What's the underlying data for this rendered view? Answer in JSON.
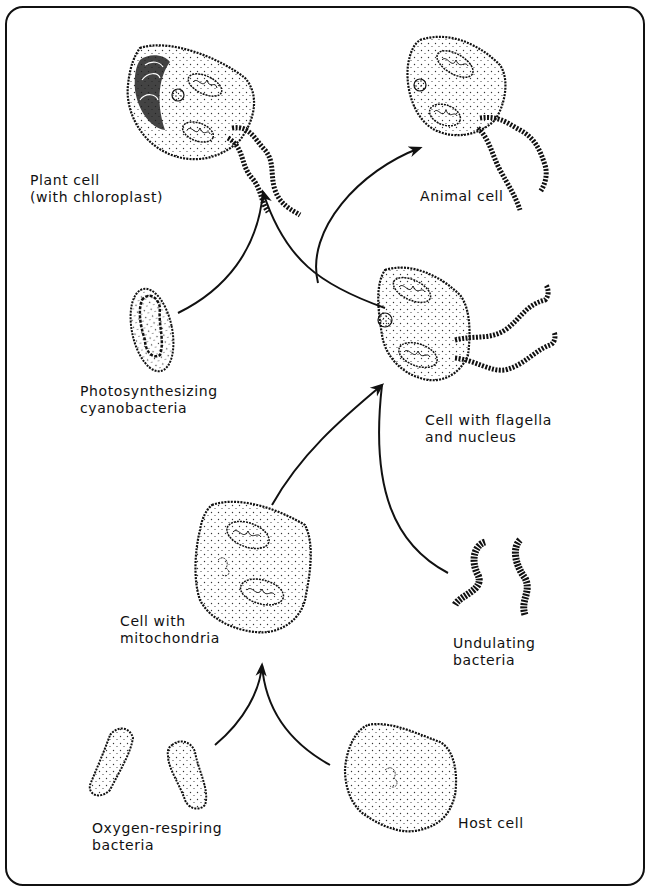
{
  "diagram": {
    "type": "endosymbiosis-flow",
    "colors": {
      "ink": "#111111",
      "background": "#ffffff",
      "stipple": "#333333"
    },
    "nodes": [
      {
        "id": "plant",
        "line1": "Plant cell",
        "line2": "(with chloroplast)"
      },
      {
        "id": "animal",
        "line1": "Animal cell",
        "line2": ""
      },
      {
        "id": "cyano",
        "line1": "Photosynthesizing",
        "line2": "cyanobacteria"
      },
      {
        "id": "flagella",
        "line1": "Cell with flagella",
        "line2": "and nucleus"
      },
      {
        "id": "mito",
        "line1": "Cell with",
        "line2": "mitochondria"
      },
      {
        "id": "undulating",
        "line1": "Undulating",
        "line2": "bacteria"
      },
      {
        "id": "oxygen",
        "line1": "Oxygen-respiring",
        "line2": "bacteria"
      },
      {
        "id": "host",
        "line1": "Host cell",
        "line2": ""
      }
    ],
    "edges": [
      {
        "from": "oxygen",
        "to": "mito"
      },
      {
        "from": "host",
        "to": "mito"
      },
      {
        "from": "mito",
        "to": "flagella"
      },
      {
        "from": "undulating",
        "to": "flagella"
      },
      {
        "from": "flagella",
        "to": "plant"
      },
      {
        "from": "cyano",
        "to": "plant"
      },
      {
        "from": "flagella",
        "to": "animal"
      }
    ]
  }
}
